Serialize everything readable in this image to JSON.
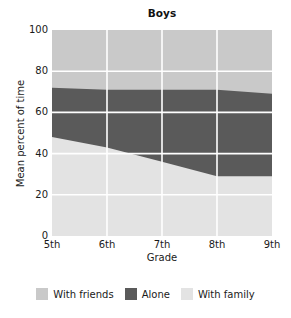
{
  "chart_data": {
    "type": "area",
    "title": "Boys",
    "xlabel": "Grade",
    "ylabel": "Mean percent of time",
    "categories": [
      "5th",
      "6th",
      "7th",
      "8th",
      "9th"
    ],
    "xtick_labels": [
      "5th",
      "6th",
      "7th",
      "8th",
      "9th"
    ],
    "ytick_labels": [
      "0",
      "20",
      "40",
      "60",
      "80",
      "100"
    ],
    "ytick_values": [
      0,
      20,
      40,
      60,
      80,
      100
    ],
    "ylim": [
      0,
      100
    ],
    "stacked": true,
    "grid": true,
    "legend_position": "bottom",
    "series": [
      {
        "name": "With family",
        "color": "#e3e3e3",
        "values": [
          48,
          43,
          36,
          29,
          29
        ]
      },
      {
        "name": "Alone",
        "color": "#5a5a5a",
        "values": [
          24,
          28,
          35,
          42,
          40
        ]
      },
      {
        "name": "With friends",
        "color": "#c9c9c9",
        "values": [
          28,
          29,
          29,
          29,
          31
        ]
      }
    ],
    "cumulative_boundaries": {
      "family_top": [
        48,
        43,
        36,
        29,
        29
      ],
      "alone_top": [
        72,
        71,
        71,
        71,
        69
      ],
      "friends_top": [
        100,
        100,
        100,
        100,
        100
      ]
    }
  },
  "legend": {
    "items": [
      {
        "label": "With friends",
        "color": "#c9c9c9"
      },
      {
        "label": "Alone",
        "color": "#5a5a5a"
      },
      {
        "label": "With family",
        "color": "#e3e3e3"
      }
    ]
  },
  "colors": {
    "with_friends": "#c9c9c9",
    "alone": "#5a5a5a",
    "with_family": "#e3e3e3",
    "gridline": "#ffffff",
    "background": "#ffffff",
    "text": "#1a1a1a"
  }
}
